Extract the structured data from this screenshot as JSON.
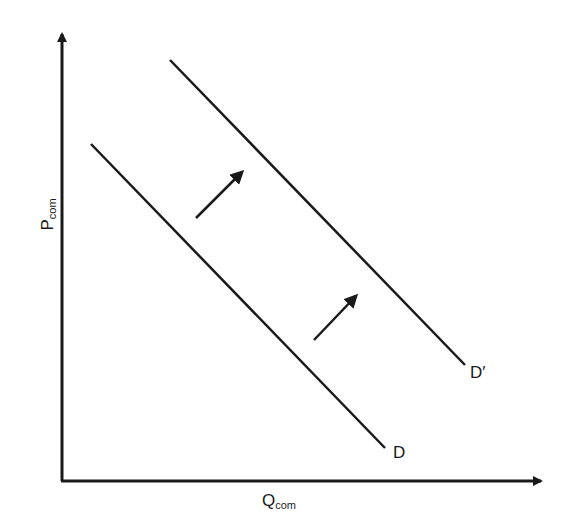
{
  "diagram": {
    "type": "supply-demand-shift",
    "y_axis": {
      "label_main": "P",
      "label_sub": "com"
    },
    "x_axis": {
      "label_main": "Q",
      "label_sub": "com"
    },
    "curves": [
      {
        "name": "D",
        "label": "D",
        "x1": 91,
        "y1": 144,
        "x2": 385,
        "y2": 448
      },
      {
        "name": "D-prime",
        "label": "D′",
        "x1": 170,
        "y1": 60,
        "x2": 465,
        "y2": 365
      }
    ],
    "shift_arrows": [
      {
        "x1": 196,
        "y1": 218,
        "x2": 242,
        "y2": 172
      },
      {
        "x1": 314,
        "y1": 340,
        "x2": 356,
        "y2": 296
      }
    ],
    "colors": {
      "line": "#1a1a1a",
      "background": "#ffffff"
    }
  }
}
